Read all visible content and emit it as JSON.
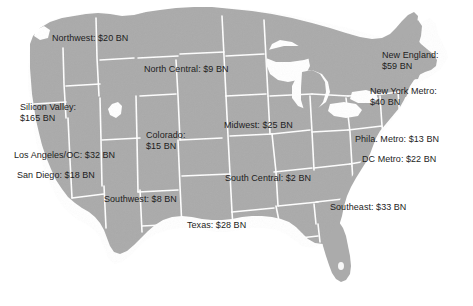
{
  "figure": {
    "background_color": "#ffffff",
    "land_color": "#ababab",
    "border_color": "#ffffff",
    "label_color": "#1d1d1d",
    "units": "BN",
    "currency": "$"
  },
  "chart_data": {
    "type": "map",
    "title": "",
    "xlabel": "",
    "ylabel": "",
    "value_unit": "USD billions",
    "value_prefix": "$",
    "value_suffix": " BN",
    "regions": [
      {
        "name": "Northwest",
        "value": 20,
        "label": "Northwest: $20 BN",
        "x": 52,
        "y": 33,
        "lines": 1
      },
      {
        "name": "North Central",
        "value": 9,
        "label": "North Central: $9 BN",
        "x": 144,
        "y": 64,
        "lines": 1
      },
      {
        "name": "Silicon Valley",
        "value": 165,
        "label": "Silicon Valley:\n$165 BN",
        "x": 20,
        "y": 102,
        "lines": 2
      },
      {
        "name": "Colorado",
        "value": 15,
        "label": "Colorado:\n$15 BN",
        "x": 146,
        "y": 130,
        "lines": 2
      },
      {
        "name": "Midwest",
        "value": 25,
        "label": "Midwest: $25 BN",
        "x": 224,
        "y": 120,
        "lines": 1
      },
      {
        "name": "Los Angeles/OC",
        "value": 32,
        "label": "Los Angeles/OC: $32 BN",
        "x": 14,
        "y": 150,
        "lines": 1
      },
      {
        "name": "San Diego",
        "value": 18,
        "label": "San Diego: $18 BN",
        "x": 17,
        "y": 170,
        "lines": 1
      },
      {
        "name": "Southwest",
        "value": 8,
        "label": "Southwest: $8 BN",
        "x": 104,
        "y": 194,
        "lines": 1
      },
      {
        "name": "South Central",
        "value": 2,
        "label": "South Central: $2 BN",
        "x": 225,
        "y": 173,
        "lines": 1
      },
      {
        "name": "Texas",
        "value": 28,
        "label": "Texas: $28 BN",
        "x": 187,
        "y": 220,
        "lines": 1
      },
      {
        "name": "Southeast",
        "value": 33,
        "label": "Southeast: $33 BN",
        "x": 330,
        "y": 202,
        "lines": 1
      },
      {
        "name": "New England",
        "value": 59,
        "label": "New England:\n$59 BN",
        "x": 382,
        "y": 50,
        "lines": 2
      },
      {
        "name": "New York Metro",
        "value": 40,
        "label": "New York Metro:\n$40 BN",
        "x": 370,
        "y": 86,
        "lines": 2
      },
      {
        "name": "Phila. Metro",
        "value": 13,
        "label": "Phila. Metro: $13 BN",
        "x": 355,
        "y": 134,
        "lines": 1
      },
      {
        "name": "DC Metro",
        "value": 22,
        "label": "DC Metro: $22 BN",
        "x": 362,
        "y": 154,
        "lines": 1
      }
    ]
  }
}
